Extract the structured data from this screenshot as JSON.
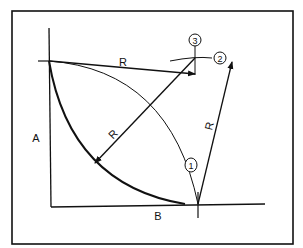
{
  "diagram": {
    "labels": {
      "a": "A",
      "b": "B",
      "r_top": "R",
      "r_diag": "R",
      "r_right": "R"
    },
    "markers": {
      "one": "1",
      "two": "2",
      "three": "3"
    },
    "colors": {
      "ink": "#111111",
      "background": "#ffffff"
    }
  }
}
